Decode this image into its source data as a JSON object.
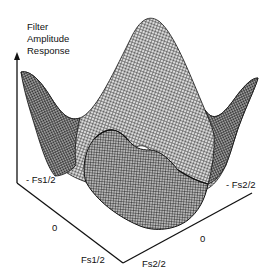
{
  "figure": {
    "z_axis_label": [
      "Filter",
      "Amplitude",
      "Response"
    ],
    "axis1": {
      "neg_label": "- Fs1/2",
      "zero_label": "0",
      "pos_label": "Fs1/2"
    },
    "axis2": {
      "neg_label": "- Fs2/2",
      "zero_label": "0",
      "pos_label": "Fs2/2"
    },
    "surface": "3D wireframe mesh of 2-D filter amplitude response with corner peaks and central dip",
    "colors": {
      "line": "#111111",
      "background": "#ffffff",
      "mesh": "#333333"
    }
  }
}
